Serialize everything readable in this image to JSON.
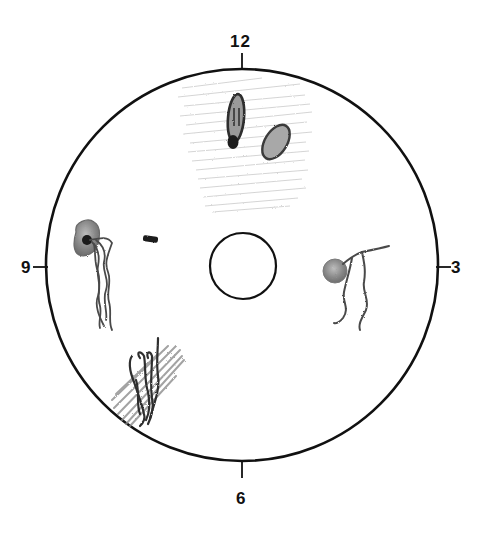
{
  "diagram": {
    "type": "clock-dial-diagram",
    "clock_labels": {
      "top": "12",
      "right": "3",
      "bottom": "6",
      "left": "9"
    },
    "outer_circle": {
      "cx": 242,
      "cy": 265,
      "r": 196,
      "stroke": "#111111"
    },
    "inner_circle": {
      "cx": 243,
      "cy": 266,
      "r": 33,
      "stroke": "#111111"
    },
    "sketches": [
      {
        "position": "12 o'clock",
        "content": "two dark oval shapes over light diagonal hatching"
      },
      {
        "position": "9-10 o'clock",
        "content": "shaded blob with long wavy tangled strands hanging down, plus a small dark dash to its right"
      },
      {
        "position": "3 o'clock",
        "content": "round shaded blob with two wavy tendrils"
      },
      {
        "position": "7-8 o'clock",
        "content": "cluster of dark curled strands over diagonal pencil shading"
      }
    ],
    "colors": {
      "line": "#111111",
      "pencil_dark": "#3a3a3a",
      "pencil_mid": "#777777",
      "pencil_light": "#c4c4c4"
    }
  }
}
